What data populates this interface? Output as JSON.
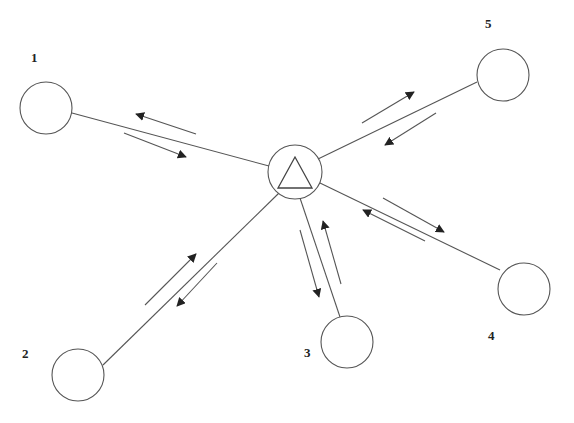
{
  "diagram": {
    "type": "star-network",
    "colors": {
      "stroke": "#555555",
      "label": "#222222",
      "background": "#ffffff"
    },
    "hub": {
      "cx": 295,
      "cy": 172,
      "r": 27,
      "icon": "triangle-icon",
      "triangle": [
        [
          295,
          157
        ],
        [
          278,
          188
        ],
        [
          312,
          188
        ]
      ]
    },
    "nodes": [
      {
        "id": "1",
        "label": "1",
        "cx": 46,
        "cy": 108,
        "r": 26,
        "label_x": 31,
        "label_y": 62
      },
      {
        "id": "2",
        "label": "2",
        "cx": 78,
        "cy": 375,
        "r": 26,
        "label_x": 22,
        "label_y": 358
      },
      {
        "id": "3",
        "label": "3",
        "cx": 347,
        "cy": 342,
        "r": 26,
        "label_x": 304,
        "label_y": 357
      },
      {
        "id": "4",
        "label": "4",
        "cx": 524,
        "cy": 289,
        "r": 26,
        "label_x": 488,
        "label_y": 340
      },
      {
        "id": "5",
        "label": "5",
        "cx": 503,
        "cy": 75,
        "r": 26,
        "label_x": 485,
        "label_y": 28
      }
    ],
    "edges": [
      {
        "node": "1",
        "x1": 72,
        "y1": 113,
        "x2": 269,
        "y2": 166,
        "arrows": [
          {
            "x1": 196,
            "y1": 134,
            "x2": 136,
            "y2": 114,
            "direction": "to-node"
          },
          {
            "x1": 124,
            "y1": 133,
            "x2": 186,
            "y2": 157,
            "direction": "to-hub"
          }
        ]
      },
      {
        "node": "2",
        "x1": 103,
        "y1": 365,
        "x2": 279,
        "y2": 193,
        "arrows": [
          {
            "x1": 145,
            "y1": 305,
            "x2": 196,
            "y2": 254,
            "direction": "to-hub"
          },
          {
            "x1": 217,
            "y1": 263,
            "x2": 177,
            "y2": 306,
            "direction": "to-node"
          }
        ]
      },
      {
        "node": "3",
        "x1": 340,
        "y1": 317,
        "x2": 300,
        "y2": 198,
        "arrows": [
          {
            "x1": 300,
            "y1": 230,
            "x2": 319,
            "y2": 297,
            "direction": "to-node"
          },
          {
            "x1": 341,
            "y1": 284,
            "x2": 323,
            "y2": 221,
            "direction": "to-hub"
          }
        ]
      },
      {
        "node": "4",
        "x1": 500,
        "y1": 270,
        "x2": 320,
        "y2": 183,
        "arrows": [
          {
            "x1": 383,
            "y1": 198,
            "x2": 444,
            "y2": 232,
            "direction": "to-node"
          },
          {
            "x1": 425,
            "y1": 241,
            "x2": 363,
            "y2": 210,
            "direction": "to-hub"
          }
        ]
      },
      {
        "node": "5",
        "x1": 477,
        "y1": 82,
        "x2": 318,
        "y2": 159,
        "arrows": [
          {
            "x1": 362,
            "y1": 123,
            "x2": 414,
            "y2": 92,
            "direction": "to-node"
          },
          {
            "x1": 436,
            "y1": 113,
            "x2": 385,
            "y2": 145,
            "direction": "to-hub"
          }
        ]
      }
    ]
  }
}
